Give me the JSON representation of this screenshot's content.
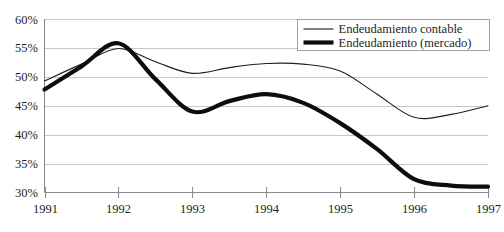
{
  "chart_data": {
    "type": "line",
    "title": "",
    "subtitle": "",
    "xlabel": "",
    "ylabel": "",
    "grid": true,
    "legend_position": "top-right",
    "xlim": [
      1991,
      1997
    ],
    "ylim": [
      30,
      60
    ],
    "y_ticks": [
      60,
      55,
      50,
      45,
      40,
      35,
      30
    ],
    "y_tick_labels": [
      "60%",
      "55%",
      "50%",
      "45%",
      "40%",
      "35%",
      "30%"
    ],
    "x_ticks": [
      1991,
      1992,
      1993,
      1994,
      1995,
      1996,
      1997
    ],
    "x_tick_labels": [
      "1991",
      "1992",
      "1993",
      "1994",
      "1995",
      "1996",
      "1997"
    ],
    "x": [
      1991,
      1991.5,
      1992,
      1992.5,
      1993,
      1993.5,
      1994,
      1994.5,
      1995,
      1995.5,
      1996,
      1996.5,
      1997
    ],
    "series": [
      {
        "name": "Endeudamiento contable",
        "style": "thin",
        "color": "#231f20",
        "values": [
          49.3,
          52.2,
          54.9,
          52.6,
          50.6,
          51.6,
          52.3,
          52.2,
          51.0,
          47.0,
          43.0,
          43.5,
          45.0
        ]
      },
      {
        "name": "Endeudamiento (mercado)",
        "style": "thick",
        "color": "#0d0d0d",
        "values": [
          47.8,
          51.8,
          55.8,
          49.6,
          44.0,
          45.8,
          47.0,
          45.5,
          42.0,
          37.5,
          32.3,
          31.2,
          31.0
        ]
      }
    ]
  },
  "legend": {
    "items": [
      {
        "label": "Endeudamiento contable",
        "style": "thin"
      },
      {
        "label": "Endeudamiento (mercado)",
        "style": "thick"
      }
    ]
  }
}
